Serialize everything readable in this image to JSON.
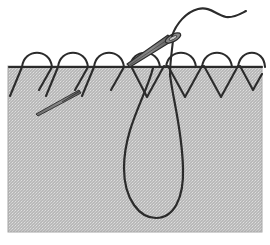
{
  "figure": {
    "title": "Suture needle passing through tissue with thread loop",
    "caption": "",
    "width": 270,
    "height": 245,
    "background_color": "#ffffff"
  },
  "colors": {
    "tissue_fill": "#b9b9b9",
    "tissue_texture": "#ffffff",
    "tissue_border": "#9a9a9a",
    "thread": "#2b2b2b",
    "needle_body": "#6e6e6e",
    "needle_outline": "#2b2b2b",
    "surface_line": "#2b2b2b"
  },
  "tissue_block": {
    "label": "tissue-block",
    "x": 8,
    "y": 66,
    "width": 254,
    "height": 166
  },
  "surface_line": {
    "label": "tissue-surface-line",
    "x1": 9,
    "y1": 67,
    "x2": 262,
    "y2": 67,
    "stroke_width": 2.2
  },
  "stitches_left": {
    "label": "completed-stitches-left",
    "arcs": [
      {
        "start_x": 22,
        "end_x": 52,
        "peak_y": 52
      },
      {
        "start_x": 58,
        "end_x": 88,
        "peak_y": 52
      },
      {
        "start_x": 94,
        "end_x": 124,
        "peak_y": 52
      }
    ],
    "legs": [
      {
        "x1": 22,
        "y1": 67,
        "x2": 10,
        "y2": 96
      },
      {
        "x1": 52,
        "y1": 67,
        "x2": 38,
        "y2": 90
      },
      {
        "x1": 58,
        "y1": 67,
        "x2": 46,
        "y2": 96
      },
      {
        "x1": 88,
        "y1": 67,
        "x2": 74,
        "y2": 90
      },
      {
        "x1": 94,
        "y1": 67,
        "x2": 82,
        "y2": 96
      },
      {
        "x1": 124,
        "y1": 67,
        "x2": 110,
        "y2": 90
      }
    ]
  },
  "stitches_right": {
    "label": "completed-stitches-right",
    "arcs": [
      {
        "start_x": 130,
        "end_x": 160,
        "peak_y": 52
      },
      {
        "start_x": 166,
        "end_x": 196,
        "peak_y": 52
      },
      {
        "start_x": 202,
        "end_x": 232,
        "peak_y": 52
      },
      {
        "start_x": 238,
        "end_x": 266,
        "peak_y": 52
      }
    ],
    "vees": [
      {
        "x1": 130,
        "y1": 67,
        "apex_x": 147,
        "apex_y": 97,
        "x2": 165,
        "y2": 67
      },
      {
        "x1": 168,
        "y1": 67,
        "apex_x": 185,
        "apex_y": 97,
        "x2": 202,
        "y2": 67
      },
      {
        "x1": 204,
        "y1": 67,
        "apex_x": 221,
        "apex_y": 97,
        "x2": 238,
        "y2": 67
      },
      {
        "x1": 240,
        "y1": 67,
        "apex_x": 252,
        "apex_y": 90,
        "x2": 262,
        "y2": 74
      }
    ]
  },
  "thread_loop": {
    "label": "thread-teardrop-loop",
    "description": "Large teardrop loop of suture thread below tissue surface",
    "entry_x": 153,
    "entry_y": 68,
    "exit_x": 170,
    "exit_y": 74,
    "bottom_y": 216,
    "left_x": 124,
    "right_x": 182
  },
  "needle_main": {
    "label": "main-suture-needle",
    "tip_x": 128,
    "tip_y": 63,
    "eye_x": 173,
    "eye_y": 38,
    "description": "Curved suture needle angled up-right with threaded eye"
  },
  "needle_secondary": {
    "label": "secondary-needle-in-tissue",
    "tip_x": 36,
    "tip_y": 114,
    "tail_x": 80,
    "tail_y": 91,
    "description": "Second needle shown embedded within tissue at lower left"
  },
  "thread_tail": {
    "label": "free-thread-tail",
    "description": "Free end of suture thread curving up and to the right above tissue",
    "start_x": 173,
    "start_y": 38,
    "end_x": 246,
    "end_y": 12
  }
}
